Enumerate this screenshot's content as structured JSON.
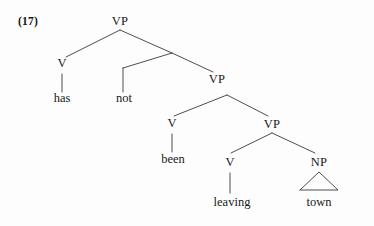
{
  "figure": {
    "example_number": "(17)",
    "kind": "syntax-tree",
    "sentence": "has not been leaving town",
    "background_color": "#fdfdfd",
    "line_color": "#3a3a3a",
    "text_color": "#191919"
  },
  "nodes": {
    "vp_top": {
      "label": "VP",
      "x": 120,
      "y": 27
    },
    "v_has": {
      "label": "V",
      "x": 62,
      "y": 69
    },
    "vp_2": {
      "label": "VP",
      "x": 217,
      "y": 86
    },
    "v_been": {
      "label": "V",
      "x": 172,
      "y": 129
    },
    "vp_3": {
      "label": "VP",
      "x": 272,
      "y": 131
    },
    "v_leaving": {
      "label": "V",
      "x": 229,
      "y": 168
    },
    "np_town": {
      "label": "NP",
      "x": 319,
      "y": 168
    }
  },
  "leaves": {
    "has": {
      "label": "has",
      "x": 62,
      "y": 104
    },
    "not": {
      "label": "not",
      "x": 124,
      "y": 104
    },
    "been": {
      "label": "been",
      "x": 173,
      "y": 165
    },
    "leaving": {
      "label": "leaving",
      "x": 232,
      "y": 208
    },
    "town": {
      "label": "town",
      "x": 319,
      "y": 208
    }
  },
  "edges": [
    {
      "name": "vp-top-to-v-has",
      "from": [
        120,
        30
      ],
      "to": [
        66,
        57
      ]
    },
    {
      "name": "vp-top-to-intermediate",
      "from": [
        120,
        30
      ],
      "to": [
        172,
        53
      ]
    },
    {
      "name": "intermediate-to-not-corner",
      "from": [
        172,
        53
      ],
      "to": [
        123,
        68
      ]
    },
    {
      "name": "not-vertical-stem",
      "from": [
        123,
        68
      ],
      "to": [
        123,
        92
      ]
    },
    {
      "name": "intermediate-to-vp2",
      "from": [
        172,
        53
      ],
      "to": [
        213,
        72
      ]
    },
    {
      "name": "v-has-stem",
      "from": [
        62,
        73
      ],
      "to": [
        62,
        92
      ]
    },
    {
      "name": "vp2-to-v-been",
      "from": [
        227,
        95
      ],
      "to": [
        174,
        116
      ]
    },
    {
      "name": "vp2-to-vp3",
      "from": [
        227,
        95
      ],
      "to": [
        268,
        116
      ]
    },
    {
      "name": "v-been-stem",
      "from": [
        172,
        133
      ],
      "to": [
        172,
        152
      ]
    },
    {
      "name": "vp3-to-v-leaving",
      "from": [
        272,
        133
      ],
      "to": [
        231,
        153
      ]
    },
    {
      "name": "vp3-to-np-town",
      "from": [
        272,
        133
      ],
      "to": [
        315,
        153
      ]
    },
    {
      "name": "v-leaving-stem",
      "from": [
        230,
        172
      ],
      "to": [
        230,
        193
      ]
    }
  ],
  "triangle": {
    "name": "np-town-triangle",
    "apex": [
      319,
      172
    ],
    "left": [
      300,
      190
    ],
    "right": [
      338,
      190
    ]
  }
}
